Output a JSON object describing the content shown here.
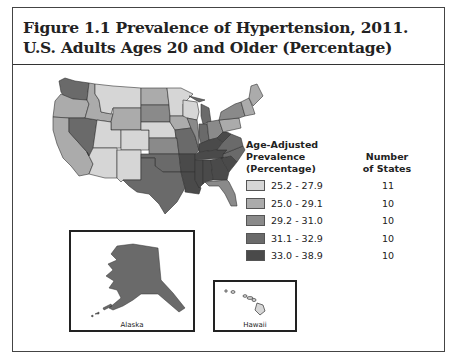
{
  "figure": {
    "title": "Figure 1.1 Prevalence of Hypertension, 2011. U.S. Adults Ages 20 and Older (Percentage)"
  },
  "legend": {
    "heading_line1": "Age-Adjusted",
    "heading_line2": "Prevalence",
    "heading_line3": "(Percentage)",
    "count_heading_line1": "Number",
    "count_heading_line2": "of States",
    "classes": [
      {
        "range": "25.2 - 27.9",
        "count": "11",
        "color": "#d6d6d6"
      },
      {
        "range": "25.0 - 29.1",
        "count": "10",
        "color": "#ababab"
      },
      {
        "range": "29.2 - 31.0",
        "count": "10",
        "color": "#8a8a8a"
      },
      {
        "range": "31.1 - 32.9",
        "count": "10",
        "color": "#6a6a6a"
      },
      {
        "range": "33.0 - 38.9",
        "count": "10",
        "color": "#4a4a4a"
      }
    ]
  },
  "insets": {
    "alaska_label": "Alaska",
    "hawaii_label": "Hawaii"
  },
  "chart_data": {
    "type": "choropleth",
    "title": "Figure 1.1 Prevalence of Hypertension, 2011. U.S. Adults Ages 20 and Older (Percentage)",
    "legend_title": "Age-Adjusted Prevalence (Percentage)",
    "classes": [
      {
        "range": "25.2 - 27.9",
        "states": 11
      },
      {
        "range": "25.0 - 29.1",
        "states": 10
      },
      {
        "range": "29.2 - 31.0",
        "states": 10
      },
      {
        "range": "31.1 - 32.9",
        "states": 10
      },
      {
        "range": "33.0 - 38.9",
        "states": 10
      }
    ],
    "regions": [
      {
        "name": "Washington",
        "class": 3
      },
      {
        "name": "Oregon",
        "class": 1
      },
      {
        "name": "California",
        "class": 1
      },
      {
        "name": "Nevada",
        "class": 3
      },
      {
        "name": "Idaho",
        "class": 1
      },
      {
        "name": "Montana",
        "class": 0
      },
      {
        "name": "Wyoming",
        "class": 1
      },
      {
        "name": "Utah",
        "class": 0
      },
      {
        "name": "Colorado",
        "class": 0
      },
      {
        "name": "Arizona",
        "class": 0
      },
      {
        "name": "New Mexico",
        "class": 0
      },
      {
        "name": "North Dakota",
        "class": 1
      },
      {
        "name": "South Dakota",
        "class": 2
      },
      {
        "name": "Nebraska",
        "class": 0
      },
      {
        "name": "Kansas",
        "class": 2
      },
      {
        "name": "Oklahoma",
        "class": 3
      },
      {
        "name": "Texas",
        "class": 3
      },
      {
        "name": "Minnesota",
        "class": 0
      },
      {
        "name": "Iowa",
        "class": 1
      },
      {
        "name": "Missouri",
        "class": 3
      },
      {
        "name": "Arkansas",
        "class": 4
      },
      {
        "name": "Louisiana",
        "class": 4
      },
      {
        "name": "Wisconsin",
        "class": 0
      },
      {
        "name": "Illinois",
        "class": 2
      },
      {
        "name": "Michigan",
        "class": 3
      },
      {
        "name": "Indiana",
        "class": 3
      },
      {
        "name": "Ohio",
        "class": 2
      },
      {
        "name": "Kentucky",
        "class": 4
      },
      {
        "name": "Tennessee",
        "class": 4
      },
      {
        "name": "Mississippi",
        "class": 4
      },
      {
        "name": "Alabama",
        "class": 4
      },
      {
        "name": "Georgia",
        "class": 4
      },
      {
        "name": "Florida",
        "class": 2
      },
      {
        "name": "South Carolina",
        "class": 4
      },
      {
        "name": "North Carolina",
        "class": 3
      },
      {
        "name": "Virginia",
        "class": 3
      },
      {
        "name": "West Virginia",
        "class": 4
      },
      {
        "name": "Pennsylvania",
        "class": 1
      },
      {
        "name": "New York",
        "class": 2
      },
      {
        "name": "New England",
        "class": 1
      },
      {
        "name": "Maine",
        "class": 1
      },
      {
        "name": "Alaska",
        "class": 3
      },
      {
        "name": "Hawaii",
        "class": 0
      }
    ]
  }
}
